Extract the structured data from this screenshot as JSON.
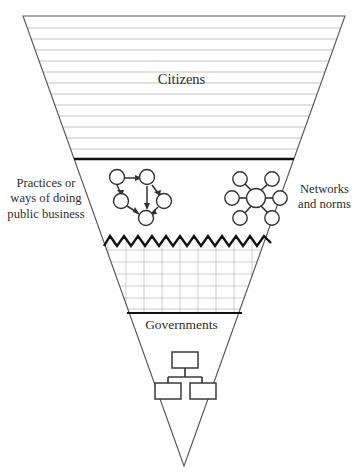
{
  "figure": {
    "type": "inverted-triangle-funnel-diagram",
    "background_color": "#ffffff",
    "outline_color": "#4a4a4a",
    "divider_color": "#1a1a1a",
    "hatch_color": "#b9b9b9",
    "grid_color": "#c9c9c9",
    "node_stroke_color": "#3a3a3a"
  },
  "labels": {
    "citizens": "Citizens",
    "governments": "Governments",
    "practices": "Practices or\nways of doing\npublic business",
    "networks": "Networks\nand norms"
  },
  "bands": [
    {
      "name": "citizens-band",
      "label": "Citizens",
      "fill_pattern": "horizontal-lines",
      "line_count": 12
    },
    {
      "name": "practices-networks-band",
      "label": "Practices or ways of doing public business / Networks and norms",
      "fill_pattern": "none",
      "icons": [
        "directed-network-icon",
        "star-network-icon"
      ]
    },
    {
      "name": "grid-band",
      "label": "",
      "fill_pattern": "grid",
      "top_border": "zigzag"
    },
    {
      "name": "governments-band",
      "label": "Governments",
      "fill_pattern": "none",
      "icons": [
        "org-chart-icon"
      ]
    }
  ],
  "icons": {
    "directed_network": {
      "name": "directed-network-icon",
      "node_count": 5,
      "edge_count": 6,
      "directed": true
    },
    "star_network": {
      "name": "star-network-icon",
      "hub_count": 1,
      "spoke_count": 6,
      "directed": false
    },
    "org_chart": {
      "name": "org-chart-icon",
      "box_count": 3,
      "levels": 2
    }
  }
}
